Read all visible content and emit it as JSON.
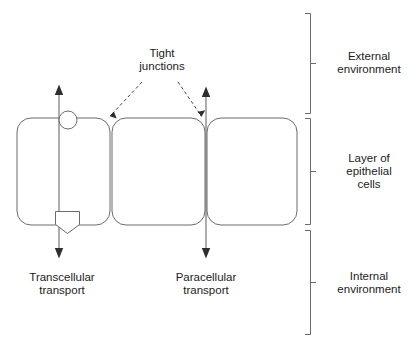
{
  "figure": {
    "background_color": "#ffffff",
    "stroke_color": "#5a5a5a",
    "text_color": "#1c1c1c",
    "arrow_color": "#3a3a3a",
    "width": 418,
    "height": 347
  },
  "labels": {
    "tight_junctions": "Tight\njunctions",
    "transcellular_transport": "Transcellular\ntransport",
    "paracellular_transport": "Paracellular\ntransport",
    "external_environment": "External\nenvironment",
    "layer_of_epithelial_cells": "Layer of\nepithelial\ncells",
    "internal_environment": "Internal\nenvironment"
  },
  "cells": [
    {
      "name": "epithelial-cell-1",
      "x": 17,
      "y": 118,
      "width": 93,
      "height": 107,
      "radius": 14
    },
    {
      "name": "epithelial-cell-2",
      "x": 112,
      "y": 118,
      "width": 93,
      "height": 107,
      "radius": 14
    },
    {
      "name": "epithelial-cell-3",
      "x": 207,
      "y": 118,
      "width": 90,
      "height": 107,
      "radius": 14
    }
  ],
  "arrows": {
    "transcellular": {
      "x": 59,
      "top_y": 85,
      "bottom_y": 258,
      "double_headed": true
    },
    "paracellular": {
      "x": 206,
      "top_y": 87,
      "bottom_y": 258,
      "double_headed": true
    }
  },
  "membrane_markers": {
    "receptor_circle": {
      "cx": 68,
      "cy": 120,
      "r": 9
    },
    "transporter_pentagon": {
      "x": 55,
      "y": 211,
      "width": 25,
      "height": 22
    }
  },
  "pointer_arrows": [
    {
      "name": "tight-junction-pointer-left",
      "from_x": 141,
      "from_y": 83,
      "to_x": 110,
      "to_y": 117,
      "dashed": true
    },
    {
      "name": "tight-junction-pointer-right",
      "from_x": 178,
      "from_y": 83,
      "to_x": 202,
      "to_y": 117,
      "dashed": true
    }
  ],
  "braces": [
    {
      "name": "brace-external-environment",
      "x": 310,
      "top_y": 13,
      "bottom_y": 113
    },
    {
      "name": "brace-epithelial-layer",
      "x": 310,
      "top_y": 118,
      "bottom_y": 225
    },
    {
      "name": "brace-internal-environment",
      "x": 310,
      "top_y": 230,
      "bottom_y": 335
    }
  ]
}
